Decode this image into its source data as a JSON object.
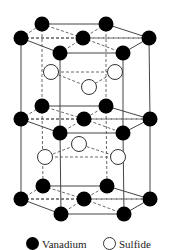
{
  "figure": {
    "colors": {
      "vanadium": "#000000",
      "sulfide_fill": "#ffffff",
      "sulfide_stroke": "#333333",
      "line": "#444444"
    },
    "vanadium_layers": [
      {
        "name": "top",
        "atoms": [
          [
            42,
            24
          ],
          [
            106,
            24
          ],
          [
            21,
            38
          ],
          [
            83,
            38
          ],
          [
            149,
            38
          ],
          [
            60,
            53
          ],
          [
            123,
            53
          ]
        ]
      },
      {
        "name": "middle",
        "atoms": [
          [
            42,
            106
          ],
          [
            106,
            106
          ],
          [
            21,
            119
          ],
          [
            84,
            119
          ],
          [
            150,
            119
          ],
          [
            60,
            133
          ],
          [
            123,
            133
          ]
        ]
      },
      {
        "name": "bottom",
        "atoms": [
          [
            43,
            186
          ],
          [
            107,
            186
          ],
          [
            21,
            199
          ],
          [
            84,
            199
          ],
          [
            150,
            199
          ],
          [
            61,
            214
          ],
          [
            124,
            214
          ]
        ]
      }
    ],
    "sulfide_atoms": [
      [
        51,
        72
      ],
      [
        115,
        72
      ],
      [
        89,
        87
      ],
      [
        79,
        144
      ],
      [
        45,
        157
      ],
      [
        118,
        157
      ]
    ]
  },
  "legend": {
    "items": [
      {
        "label": "Vanadium",
        "symbol": "filled-circle"
      },
      {
        "label": "Sulfide",
        "symbol": "hollow-circle"
      }
    ]
  }
}
